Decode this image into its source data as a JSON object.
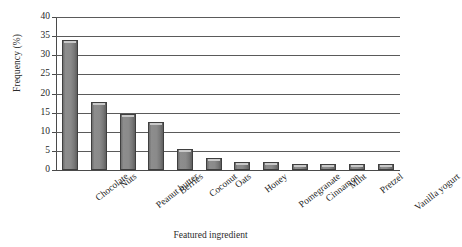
{
  "chart_data": {
    "type": "bar",
    "title": "",
    "xlabel": "Featured ingredient",
    "ylabel": "Frequency (%)",
    "ylim": [
      0,
      40
    ],
    "ytick_step": 5,
    "yticks": [
      0,
      5,
      10,
      15,
      20,
      25,
      30,
      35,
      40
    ],
    "grid": true,
    "legend": "none",
    "bar_color": "#8a8a8a",
    "bar_edge_color": "#3f3f3f",
    "categories": [
      "Chocolate",
      "Nuts",
      "Peanut butter",
      "Berries",
      "Coconut",
      "Oats",
      "Honey",
      "Pomegranate",
      "Cinnamon",
      "Mint",
      "Pretzel",
      "Vanilla yogurt"
    ],
    "values": [
      34,
      17.8,
      14.7,
      12.5,
      5.5,
      3.2,
      2.2,
      2.2,
      1.6,
      1.6,
      1.6,
      1.6
    ]
  }
}
